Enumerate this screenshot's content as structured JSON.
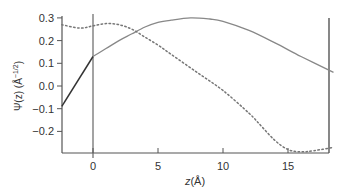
{
  "chart_data": {
    "type": "line",
    "title": "",
    "xlabel": "z(Å)",
    "ylabel": "Ψ(z) (Å^-1/2)",
    "ylabel_main": "Ψ(z) (Å",
    "ylabel_sup": "−1/2",
    "ylabel_close": ")",
    "xlim": [
      -2.4,
      18.5
    ],
    "ylim": [
      -0.3,
      0.3
    ],
    "x_ticks": [
      0,
      5,
      10,
      15
    ],
    "x_tick_labels": [
      "0",
      "5",
      "10",
      "15"
    ],
    "y_ticks": [
      0.3,
      0.2,
      0.1,
      0.0,
      -0.1,
      -0.2
    ],
    "y_tick_labels": [
      "0.3",
      "0.2",
      "0.1",
      "0.0",
      "−0.1",
      "−0.2"
    ],
    "grid": false,
    "legend": null,
    "annotations": [
      {
        "type": "vertical-line",
        "x": 0
      }
    ],
    "series": [
      {
        "name": "solid",
        "style": "solid",
        "color": "#888888",
        "x": [
          -2.4,
          0,
          1,
          2,
          3,
          4,
          5,
          6,
          7.5,
          9,
          10,
          12,
          14,
          16,
          18.5
        ],
        "y": [
          -0.09,
          0.13,
          0.165,
          0.2,
          0.23,
          0.26,
          0.28,
          0.29,
          0.3,
          0.295,
          0.285,
          0.245,
          0.19,
          0.13,
          0.06
        ]
      },
      {
        "name": "dotted",
        "style": "dotted",
        "color": "#777777",
        "x": [
          -2.4,
          -1,
          0,
          1,
          2,
          3,
          4,
          5,
          6,
          8,
          10,
          12,
          13,
          14,
          15,
          16,
          17,
          18.5
        ],
        "y": [
          0.27,
          0.255,
          0.265,
          0.275,
          0.27,
          0.25,
          0.215,
          0.18,
          0.14,
          0.06,
          -0.02,
          -0.12,
          -0.18,
          -0.24,
          -0.28,
          -0.29,
          -0.285,
          -0.27
        ]
      }
    ]
  }
}
